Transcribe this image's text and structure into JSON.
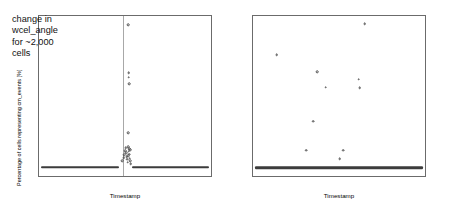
{
  "figure": {
    "panels": [
      {
        "id": "cm-events",
        "annotation": "change in\nwcel_angle\nfor ~2,000\ncells"
      },
      {
        "id": "weather-events"
      }
    ]
  },
  "chart_data": [
    {
      "type": "scatter",
      "title": "",
      "annotation": "change in wcel_angle for ~2,000 cells",
      "xlabel": "Timestamp",
      "ylabel": "Percentage of cells representing cm_events [%]",
      "xticklabels": [
        "02/01/2013",
        "02/08/2013",
        "02/15/2013",
        "02/22/2013"
      ],
      "xtick_positions": [
        1,
        8,
        15,
        22
      ],
      "xlim": [
        -1.5,
        24.5
      ],
      "yticklabels": [
        "0",
        "2",
        "4",
        "6"
      ],
      "ytick_values": [
        0,
        2,
        4,
        6
      ],
      "ylim": [
        -0.45,
        7.55
      ],
      "grid": false,
      "legend": null,
      "vertical_reference_line_x": 11.2,
      "baseline_segments": [
        {
          "x_start": -1.2,
          "x_end": 10.6,
          "y": 0
        },
        {
          "x_start": 12.6,
          "x_end": 24.2,
          "y": 0
        }
      ],
      "points": [
        {
          "x": 11.1,
          "y": 0.3
        },
        {
          "x": 11.3,
          "y": 0.46
        },
        {
          "x": 11.4,
          "y": 0.62
        },
        {
          "x": 11.5,
          "y": 0.8
        },
        {
          "x": 11.6,
          "y": 0.96
        },
        {
          "x": 11.7,
          "y": 0.7
        },
        {
          "x": 11.75,
          "y": 0.52
        },
        {
          "x": 11.85,
          "y": 0.38
        },
        {
          "x": 11.9,
          "y": 0.24
        },
        {
          "x": 12.0,
          "y": 0.55
        },
        {
          "x": 12.05,
          "y": 0.78
        },
        {
          "x": 12.15,
          "y": 0.64
        },
        {
          "x": 12.2,
          "y": 0.44
        },
        {
          "x": 12.3,
          "y": 0.3
        },
        {
          "x": 12.35,
          "y": 0.16
        },
        {
          "x": 12.1,
          "y": 0.9
        },
        {
          "x": 11.95,
          "y": 1.02
        },
        {
          "x": 12.25,
          "y": 0.86
        },
        {
          "x": 12.0,
          "y": 1.7
        },
        {
          "x": 12.1,
          "y": 4.15
        },
        {
          "x": 12.05,
          "y": 4.48
        },
        {
          "x": 12.05,
          "y": 4.72
        },
        {
          "x": 12.0,
          "y": 7.1
        }
      ]
    },
    {
      "type": "scatter",
      "title": "",
      "xlabel": "Timestamp",
      "ylabel": "Percentage of cells representing weather_events [%]",
      "xticklabels": [
        "02/01/2013",
        "02/08/2013",
        "02/15/2013",
        "02/22/2013"
      ],
      "xtick_positions": [
        1,
        8,
        15,
        22
      ],
      "xlim": [
        -1.5,
        24.5
      ],
      "yticklabels": [
        "0.0",
        "0.1",
        "0.2",
        "0.3"
      ],
      "ytick_values": [
        0.0,
        0.1,
        0.2,
        0.3
      ],
      "ylim": [
        -0.022,
        0.392
      ],
      "grid": false,
      "legend": null,
      "baseline_segments": [
        {
          "x_start": -1.2,
          "x_end": 24.2,
          "y": 0
        }
      ],
      "points": [
        {
          "x": 2.1,
          "y": 0.292
        },
        {
          "x": 6.5,
          "y": 0.045
        },
        {
          "x": 7.6,
          "y": 0.12
        },
        {
          "x": 8.2,
          "y": 0.248
        },
        {
          "x": 9.5,
          "y": 0.208
        },
        {
          "x": 11.6,
          "y": 0.022
        },
        {
          "x": 12.1,
          "y": 0.045
        },
        {
          "x": 14.5,
          "y": 0.228
        },
        {
          "x": 14.6,
          "y": 0.206
        },
        {
          "x": 15.4,
          "y": 0.372
        }
      ]
    }
  ]
}
